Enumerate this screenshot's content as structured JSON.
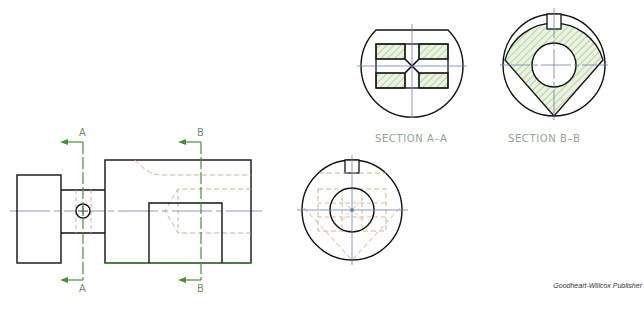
{
  "figure": {
    "views": {
      "front_view": {
        "name": "Front view"
      },
      "side_view": {
        "name": "Side (end) view"
      },
      "section_a": {
        "title": "SECTION A–A"
      },
      "section_b": {
        "title": "SECTION B–B"
      }
    },
    "cutting_planes": [
      {
        "id": "A",
        "top_label": "A",
        "bottom_label": "A"
      },
      {
        "id": "B",
        "top_label": "B",
        "bottom_label": "B"
      }
    ],
    "credit": "Goodheart-Willcox Publisher"
  },
  "colors": {
    "object_line": "#111111",
    "hidden_line": "#c8a88a",
    "center_line": "#6f7fb0",
    "cutting_plane": "#4f8a3f",
    "hatch_fill": "#e8f2dc",
    "hatch_line": "#6e9a5e",
    "label_text": "#8fa68f"
  }
}
